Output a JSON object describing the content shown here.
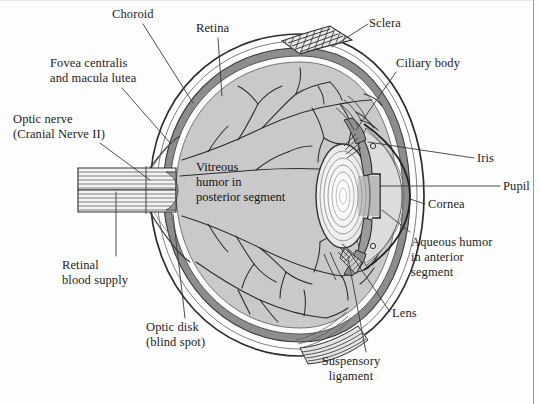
{
  "figure": {
    "type": "anatomical-diagram",
    "background_color": "#fdfdfd",
    "frame_color": "#9a9a9a"
  },
  "labels": {
    "choroid": "Choroid",
    "retina": "Retina",
    "sclera": "Sclera",
    "ciliary_body": "Ciliary body",
    "iris": "Iris",
    "pupil": "Pupil",
    "cornea": "Cornea",
    "fovea_line1": "Fovea centralis",
    "fovea_line2": "and macula lutea",
    "optic_nerve_line1": "Optic nerve",
    "optic_nerve_line2": "(Cranial Nerve II)",
    "retinal_blood_line1": "Retinal",
    "retinal_blood_line2": "blood supply",
    "optic_disk_line1": "Optic disk",
    "optic_disk_line2": "(blind spot)",
    "suspensory_line1": "Suspensory",
    "suspensory_line2": "ligament",
    "aqueous_line1": "Aqueous humor",
    "aqueous_line2": "in anterior",
    "aqueous_line3": "segment",
    "lens": "Lens",
    "vitreous_line1": "Vitreous",
    "vitreous_line2": "humor in",
    "vitreous_line3": "posterior segment"
  },
  "colors": {
    "ink": "#1c1c1c",
    "leader_line": "#3a3a3a",
    "sclera_fill": "#ffffff",
    "choroid_fill": "#8d8d8d",
    "vitreous_fill": "#c9c9c9",
    "anterior_fill": "#dcdcdc",
    "lens_fill": "#f6f6f6",
    "pupil_fill": "#9e9e9e",
    "vessel": "#2e2e2e",
    "muscle_hatch": "#4a4a4a"
  }
}
